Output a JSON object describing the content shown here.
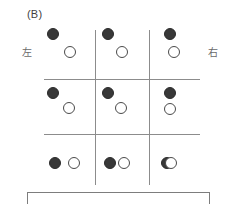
{
  "figure": {
    "panel_label": "(B)",
    "left_axis_label": "左",
    "right_axis_label": "右",
    "background_color": "#ffffff",
    "line_color": "#8c8c8c",
    "filled_dot_color": "#383838",
    "open_dot_color": "#ffffff",
    "open_dot_border_color": "#4a4a4a"
  },
  "grid": {
    "rows": 3,
    "columns": 3,
    "left": 44,
    "top": 30,
    "right": 200,
    "bottom": 185,
    "vertical_lines_x": [
      95,
      149
    ],
    "horizontal_lines_y": [
      79,
      134
    ]
  },
  "bracket": {
    "left": 27,
    "top": 192,
    "width": 183,
    "height": 12,
    "color": "#7d7d7d"
  },
  "cells": [
    {
      "row": 0,
      "column": 0,
      "name": "cell-r1c1",
      "dots": [
        {
          "type": "filled",
          "cx": 53,
          "cy": 34,
          "r": 6
        },
        {
          "type": "open",
          "cx": 70,
          "cy": 52,
          "r": 6
        }
      ]
    },
    {
      "row": 0,
      "column": 1,
      "name": "cell-r1c2",
      "dots": [
        {
          "type": "filled",
          "cx": 108,
          "cy": 34,
          "r": 6
        },
        {
          "type": "open",
          "cx": 122,
          "cy": 52,
          "r": 6
        }
      ]
    },
    {
      "row": 0,
      "column": 2,
      "name": "cell-r1c3",
      "dots": [
        {
          "type": "filled",
          "cx": 170,
          "cy": 34,
          "r": 6
        },
        {
          "type": "open",
          "cx": 174,
          "cy": 52,
          "r": 6
        }
      ]
    },
    {
      "row": 1,
      "column": 0,
      "name": "cell-r2c1",
      "dots": [
        {
          "type": "filled",
          "cx": 53,
          "cy": 93,
          "r": 6
        },
        {
          "type": "open",
          "cx": 69,
          "cy": 108,
          "r": 6
        }
      ]
    },
    {
      "row": 1,
      "column": 1,
      "name": "cell-r2c2",
      "dots": [
        {
          "type": "filled",
          "cx": 108,
          "cy": 93,
          "r": 6
        },
        {
          "type": "open",
          "cx": 121,
          "cy": 108,
          "r": 6
        }
      ]
    },
    {
      "row": 1,
      "column": 2,
      "name": "cell-r2c3",
      "dots": [
        {
          "type": "filled",
          "cx": 170,
          "cy": 93,
          "r": 6
        },
        {
          "type": "open",
          "cx": 170,
          "cy": 109,
          "r": 6
        }
      ]
    },
    {
      "row": 2,
      "column": 0,
      "name": "cell-r3c1",
      "dots": [
        {
          "type": "filled",
          "cx": 55,
          "cy": 163,
          "r": 6
        },
        {
          "type": "open",
          "cx": 74,
          "cy": 163,
          "r": 6
        }
      ]
    },
    {
      "row": 2,
      "column": 1,
      "name": "cell-r3c2",
      "dots": [
        {
          "type": "filled",
          "cx": 110,
          "cy": 163,
          "r": 6
        },
        {
          "type": "open",
          "cx": 124,
          "cy": 163,
          "r": 6
        }
      ]
    },
    {
      "row": 2,
      "column": 2,
      "name": "cell-r3c3",
      "overlap": true,
      "dots": [
        {
          "type": "filled",
          "cx": 167,
          "cy": 163,
          "r": 6
        },
        {
          "type": "open",
          "cx": 171,
          "cy": 163,
          "r": 6
        }
      ]
    }
  ]
}
